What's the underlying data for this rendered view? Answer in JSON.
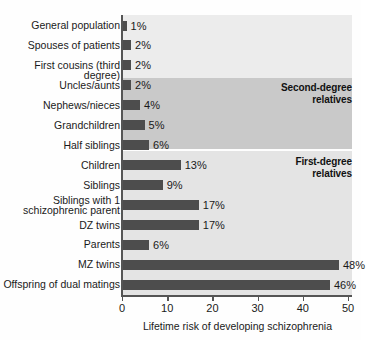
{
  "chart_data": {
    "type": "bar",
    "orientation": "horizontal",
    "title": "",
    "xlabel": "Lifetime risk of developing schizophrenia",
    "ylabel": "",
    "xlim": [
      0,
      55
    ],
    "xticks": [
      0,
      10,
      20,
      30,
      40,
      50
    ],
    "xtick_labels": [
      "0",
      "10",
      "20",
      "30",
      "40",
      "50"
    ],
    "grid": false,
    "legend": null,
    "value_suffix": "%",
    "categories": [
      "General population",
      "Spouses of patients",
      "First cousins (third degree)",
      "Uncles/aunts",
      "Nephews/nieces",
      "Grandchildren",
      "Half siblings",
      "Children",
      "Siblings",
      "Siblings with 1\nschizophrenic parent",
      "DZ twins",
      "Parents",
      "MZ twins",
      "Offspring of dual matings"
    ],
    "values": [
      1,
      2,
      2,
      2,
      4,
      5,
      6,
      13,
      9,
      17,
      17,
      6,
      48,
      46
    ],
    "value_labels": [
      "1%",
      "2%",
      "2%",
      "2%",
      "4%",
      "5%",
      "6%",
      "13%",
      "9%",
      "17%",
      "17%",
      "6%",
      "48%",
      "46%"
    ],
    "annotations": [
      {
        "text": "Second-degree\nrelatives",
        "covers_categories": [
          "Uncles/aunts",
          "Nephews/nieces",
          "Grandchildren",
          "Half siblings"
        ]
      },
      {
        "text": "First-degree\nrelatives",
        "covers_categories": [
          "Children",
          "Siblings",
          "Siblings with 1 schizophrenic parent",
          "DZ twins",
          "Parents",
          "MZ twins",
          "Offspring of dual matings"
        ]
      }
    ],
    "colors": {
      "bar": "#4d4d4d",
      "band_second_degree": "#c9c9c9",
      "band_first_degree": "#e4e4e4",
      "plot_background": "#ececec",
      "axis": "#555555",
      "text": "#1a1a1a"
    }
  }
}
